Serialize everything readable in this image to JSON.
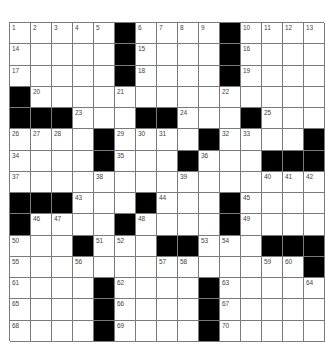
{
  "puzzle": {
    "rows": 15,
    "cols": 15,
    "colors": {
      "block": "#000000",
      "cell": "#ffffff",
      "gridline": "#7a7a7a",
      "number": "#444444"
    },
    "grid": [
      [
        "1",
        "2",
        "3",
        "4",
        "5",
        "#",
        "6",
        "7",
        "8",
        "9",
        "#",
        "10",
        "11",
        "12",
        "13"
      ],
      [
        "14",
        ".",
        ".",
        ".",
        ".",
        "#",
        "15",
        ".",
        ".",
        ".",
        "#",
        "16",
        ".",
        ".",
        "."
      ],
      [
        "17",
        ".",
        ".",
        ".",
        ".",
        "#",
        "18",
        ".",
        ".",
        ".",
        "#",
        "19",
        ".",
        ".",
        "."
      ],
      [
        "#",
        "20",
        ".",
        ".",
        ".",
        "21",
        ".",
        ".",
        ".",
        ".",
        "22",
        ".",
        ".",
        ".",
        "."
      ],
      [
        "#",
        "#",
        "#",
        "23",
        ".",
        ".",
        "#",
        "#",
        "24",
        ".",
        ".",
        "#",
        "25",
        ".",
        "."
      ],
      [
        "26",
        "27",
        "28",
        ".",
        "#",
        "29",
        "30",
        "31",
        ".",
        "#",
        "32",
        "33",
        ".",
        ".",
        "#"
      ],
      [
        "34",
        ".",
        ".",
        ".",
        "#",
        "35",
        ".",
        ".",
        "#",
        "36",
        ".",
        ".",
        "#",
        "#",
        "#"
      ],
      [
        "37",
        ".",
        ".",
        ".",
        "38",
        ".",
        ".",
        ".",
        "39",
        ".",
        ".",
        ".",
        "40",
        "41",
        "42"
      ],
      [
        "#",
        "#",
        "#",
        "43",
        ".",
        ".",
        "#",
        "44",
        ".",
        ".",
        "#",
        "45",
        ".",
        ".",
        "."
      ],
      [
        "#",
        "46",
        "47",
        ".",
        ".",
        "#",
        "48",
        ".",
        ".",
        ".",
        "#",
        "49",
        ".",
        ".",
        "."
      ],
      [
        "50",
        ".",
        ".",
        "#",
        "51",
        "52",
        ".",
        "#",
        "#",
        "53",
        "54",
        ".",
        "#",
        "#",
        "#"
      ],
      [
        "55",
        ".",
        ".",
        "56",
        ".",
        ".",
        ".",
        "57",
        "58",
        ".",
        ".",
        ".",
        "59",
        "60",
        "#"
      ],
      [
        "61",
        ".",
        ".",
        ".",
        "#",
        "62",
        ".",
        ".",
        ".",
        "#",
        "63",
        ".",
        ".",
        ".",
        "64"
      ],
      [
        "65",
        ".",
        ".",
        ".",
        "#",
        "66",
        ".",
        ".",
        ".",
        "#",
        "67",
        ".",
        ".",
        ".",
        "."
      ],
      [
        "68",
        ".",
        ".",
        ".",
        "#",
        "69",
        ".",
        ".",
        ".",
        "#",
        "70",
        ".",
        ".",
        ".",
        "."
      ]
    ]
  }
}
